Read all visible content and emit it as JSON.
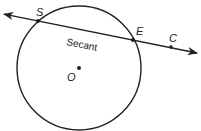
{
  "diagram": {
    "colors": {
      "stroke": "#222222",
      "background": "#ffffff"
    },
    "circle": {
      "center_label": "O",
      "cx": 79,
      "cy": 68,
      "r": 62
    },
    "line": {
      "label": "Secant",
      "start": [
        3,
        14
      ],
      "end": [
        197,
        53
      ],
      "arrowheads": "both"
    },
    "points": [
      {
        "label": "S",
        "x": 38,
        "y": 21,
        "label_x": 36,
        "label_y": 16
      },
      {
        "label": "E",
        "x": 133,
        "y": 40,
        "label_x": 136,
        "label_y": 35
      },
      {
        "label": "C",
        "x": 171,
        "y": 47,
        "label_x": 169,
        "label_y": 42
      },
      {
        "label": "O",
        "x": 79,
        "y": 68,
        "label_x": 67,
        "label_y": 81
      }
    ],
    "secant_label_pos": [
      66,
      45
    ]
  }
}
